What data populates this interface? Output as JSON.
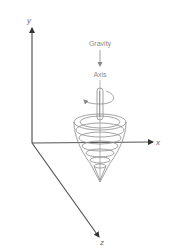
{
  "diagram": {
    "type": "spinning-top-on-3d-axes",
    "labels": {
      "gravity": "Gravity",
      "axis": "Axis",
      "x_axis": "x",
      "y_axis": "y",
      "z_axis": "z"
    },
    "colors": {
      "axes": "#555555",
      "top": "#8c8c8c",
      "text": "#8a8a8a"
    }
  }
}
